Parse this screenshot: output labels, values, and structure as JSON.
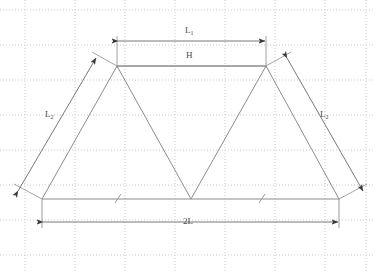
{
  "diagram": {
    "canvas": {
      "width": 375,
      "height": 273
    },
    "colors": {
      "grid_major": "#c8c8c8",
      "grid_minor": "#d8d8d8",
      "profile_stroke": "#8a8a8a",
      "dimension_stroke": "#6a6a6a",
      "arrow_fill": "#3a3a3a",
      "label_text": "#4a4a4a",
      "background": "#ffffff"
    },
    "grid": {
      "visible": true,
      "style": "dotted",
      "x_lines": [
        25,
        75,
        125,
        175,
        225,
        275,
        325,
        366
      ],
      "y_lines": [
        10,
        45,
        80,
        115,
        150,
        185,
        220,
        255
      ]
    },
    "geometry": {
      "baseline_y": 199,
      "peak_y": 66,
      "points": [
        {
          "name": "bottom-left",
          "x": 42,
          "y": 199
        },
        {
          "name": "left-peak",
          "x": 117,
          "y": 66
        },
        {
          "name": "valley",
          "x": 191,
          "y": 199
        },
        {
          "name": "right-peak",
          "x": 266,
          "y": 66
        },
        {
          "name": "bottom-right",
          "x": 339,
          "y": 199
        }
      ]
    },
    "dimensions": [
      {
        "id": "top-span",
        "label": "L",
        "subscript": "1",
        "orientation": "horizontal",
        "line_y": 41,
        "x_start": 117,
        "x_end": 266,
        "label_x": 188,
        "label_y": 29
      },
      {
        "id": "height-ref",
        "label": "H",
        "subscript": "",
        "orientation": "horizontal",
        "line_y": 66,
        "x_start": 117,
        "x_end": 266,
        "label_x": 189,
        "label_y": 54
      },
      {
        "id": "left-slope",
        "label": "L",
        "subscript": "2",
        "orientation": "diagonal",
        "x_start": 17,
        "y_start": 190,
        "x_end": 95,
        "y_end": 57,
        "label_x": 48,
        "label_y": 114
      },
      {
        "id": "right-slope",
        "label": "L",
        "subscript": "2",
        "orientation": "diagonal",
        "x_start": 288,
        "y_start": 57,
        "x_end": 364,
        "y_end": 190,
        "label_x": 323,
        "label_y": 114
      },
      {
        "id": "base-span",
        "label": "2L",
        "subscript": "",
        "orientation": "horizontal",
        "line_y": 222,
        "x_start": 42,
        "x_end": 339,
        "label_x": 185,
        "label_y": 220
      }
    ],
    "tick_marks": [
      {
        "id": "left-base-tick",
        "x": 118,
        "y": 199
      },
      {
        "id": "right-base-tick",
        "x": 262,
        "y": 199
      }
    ]
  }
}
